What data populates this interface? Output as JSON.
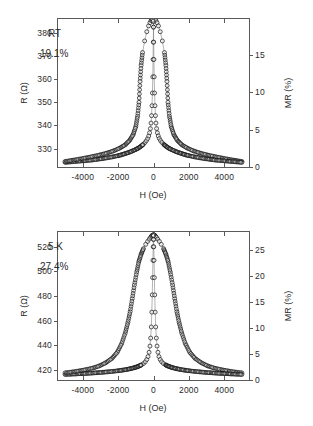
{
  "figure": {
    "background": "#ffffff",
    "axis_color": "#5a5a5a",
    "marker_color": "#111111"
  },
  "panels": [
    {
      "id": "panel-top",
      "annotation_label": "RT",
      "annotation_value": "19.1%",
      "x_axis": {
        "title": "H (Oe)",
        "min": -5400,
        "max": 5400,
        "ticks": [
          -4000,
          -2000,
          0,
          2000,
          4000
        ],
        "tick_labels": [
          "-4000",
          "-2000",
          "0",
          "2000",
          "4000"
        ]
      },
      "y_left": {
        "title": "R (Ω)",
        "min": 322,
        "max": 386,
        "ticks": [
          330,
          340,
          350,
          360,
          370,
          380
        ],
        "tick_labels": [
          "330",
          "340",
          "350",
          "360",
          "370",
          "380"
        ]
      },
      "y_right": {
        "title": "MR (%)",
        "min": 0,
        "max": 19.8,
        "ticks": [
          0,
          5,
          10,
          15
        ],
        "tick_labels": [
          "0",
          "5",
          "10",
          "15"
        ]
      }
    },
    {
      "id": "panel-bottom",
      "annotation_label": "5 K",
      "annotation_value": "27.4%",
      "x_axis": {
        "title": "H (Oe)",
        "min": -5400,
        "max": 5400,
        "ticks": [
          -4000,
          -2000,
          0,
          2000,
          4000
        ],
        "tick_labels": [
          "-4000",
          "-2000",
          "0",
          "2000",
          "4000"
        ]
      },
      "y_left": {
        "title": "R (Ω)",
        "min": 412,
        "max": 532,
        "ticks": [
          420,
          440,
          460,
          480,
          500,
          520
        ],
        "tick_labels": [
          "420",
          "440",
          "460",
          "480",
          "500",
          "520"
        ]
      },
      "y_right": {
        "title": "MR (%)",
        "min": 0,
        "max": 28.5,
        "ticks": [
          0,
          5,
          10,
          15,
          20,
          25
        ],
        "tick_labels": [
          "0",
          "5",
          "10",
          "15",
          "20",
          "25"
        ]
      }
    }
  ],
  "chart_data": [
    {
      "type": "scatter",
      "title": "",
      "panel": "RT",
      "xlabel": "H (Oe)",
      "ylabel": "R (Ω)",
      "y2label": "MR (%)",
      "xlim": [
        -5400,
        5400
      ],
      "ylim": [
        322,
        386
      ],
      "y2lim": [
        0,
        19.8
      ],
      "grid": false,
      "legend": null,
      "marker": "open-circle",
      "annotations": [
        "RT",
        "19.1%"
      ],
      "series": [
        {
          "name": "decreasing-field-branch",
          "x": [
            -5000,
            -4700,
            -4400,
            -4100,
            -3800,
            -3500,
            -3200,
            -2900,
            -2600,
            -2300,
            -2000,
            -1800,
            -1600,
            -1400,
            -1200,
            -1000,
            -850,
            -700,
            -580,
            -480,
            -400,
            -330,
            -270,
            -220,
            -175,
            -140,
            -110,
            -85,
            -60,
            -40,
            -25,
            -12,
            0,
            15,
            35,
            60,
            95,
            140,
            200,
            280,
            380,
            500,
            620,
            700,
            760,
            820,
            900,
            1000,
            1150,
            1350,
            1600,
            1900,
            2250,
            2600,
            3000,
            3400,
            3800,
            4200,
            4600,
            5000
          ],
          "y": [
            324.0,
            324.2,
            324.4,
            324.6,
            324.8,
            325.0,
            325.3,
            325.6,
            326.0,
            326.4,
            326.9,
            327.3,
            327.8,
            328.3,
            328.9,
            329.6,
            330.2,
            331.0,
            331.8,
            332.6,
            333.4,
            334.3,
            335.4,
            336.8,
            338.6,
            341.0,
            344.2,
            348.5,
            354.0,
            361.0,
            368.5,
            376.0,
            382.5,
            385.0,
            385.6,
            385.8,
            385.7,
            385.3,
            384.4,
            383.0,
            380.5,
            376.5,
            371.5,
            366.0,
            359.0,
            350.0,
            344.0,
            339.5,
            336.0,
            333.5,
            331.6,
            330.2,
            329.0,
            328.1,
            327.3,
            326.6,
            326.0,
            325.4,
            324.9,
            324.4
          ]
        },
        {
          "name": "increasing-field-branch",
          "x": [
            -5000,
            -4600,
            -4200,
            -3800,
            -3400,
            -3000,
            -2600,
            -2250,
            -1900,
            -1600,
            -1350,
            -1150,
            -1000,
            -900,
            -820,
            -760,
            -700,
            -620,
            -500,
            -380,
            -280,
            -200,
            -140,
            -95,
            -60,
            -35,
            -15,
            0,
            12,
            25,
            40,
            60,
            85,
            110,
            140,
            175,
            220,
            270,
            330,
            400,
            480,
            580,
            700,
            850,
            1000,
            1200,
            1400,
            1600,
            1800,
            2000,
            2300,
            2600,
            2900,
            3200,
            3500,
            3800,
            4100,
            4400,
            4700,
            5000
          ],
          "y": [
            324.4,
            324.9,
            325.4,
            326.0,
            326.6,
            327.3,
            328.1,
            329.0,
            330.2,
            331.6,
            333.5,
            336.0,
            339.5,
            344.0,
            350.0,
            359.0,
            366.0,
            371.5,
            376.5,
            380.5,
            383.0,
            384.4,
            385.3,
            385.7,
            385.8,
            385.6,
            385.0,
            382.5,
            376.0,
            368.5,
            361.0,
            354.0,
            348.5,
            344.2,
            341.0,
            338.6,
            336.8,
            335.4,
            334.3,
            333.4,
            332.6,
            331.8,
            331.0,
            330.2,
            329.6,
            328.9,
            328.3,
            327.8,
            327.3,
            326.9,
            326.4,
            326.0,
            325.6,
            325.3,
            325.0,
            324.8,
            324.6,
            324.4,
            324.2,
            324.0
          ]
        }
      ]
    },
    {
      "type": "scatter",
      "title": "",
      "panel": "5 K",
      "xlabel": "H (Oe)",
      "ylabel": "R (Ω)",
      "y2label": "MR (%)",
      "xlim": [
        -5400,
        5400
      ],
      "ylim": [
        412,
        532
      ],
      "y2lim": [
        0,
        28.5
      ],
      "grid": false,
      "legend": null,
      "marker": "open-circle",
      "annotations": [
        "5 K",
        "27.4%"
      ],
      "series": [
        {
          "name": "decreasing-field-branch",
          "x": [
            -5000,
            -4700,
            -4400,
            -4100,
            -3800,
            -3500,
            -3200,
            -2900,
            -2600,
            -2300,
            -2000,
            -1750,
            -1500,
            -1300,
            -1100,
            -950,
            -800,
            -680,
            -560,
            -460,
            -380,
            -310,
            -250,
            -200,
            -160,
            -125,
            -95,
            -70,
            -50,
            -32,
            -18,
            -8,
            0,
            10,
            25,
            45,
            75,
            115,
            170,
            240,
            330,
            440,
            570,
            700,
            830,
            950,
            1080,
            1200,
            1320,
            1450,
            1600,
            1800,
            2050,
            2350,
            2700,
            3050,
            3400,
            3800,
            4200,
            4600,
            5000
          ],
          "y": [
            416.5,
            416.7,
            416.9,
            417.1,
            417.3,
            417.6,
            417.9,
            418.2,
            418.6,
            419.0,
            419.5,
            420.0,
            420.6,
            421.2,
            421.9,
            422.6,
            423.4,
            424.3,
            425.4,
            426.8,
            428.6,
            431.0,
            434.5,
            439.5,
            446.0,
            455.0,
            467.0,
            481.0,
            495.0,
            509.0,
            520.0,
            526.0,
            529.0,
            529.5,
            529.6,
            529.5,
            529.2,
            528.6,
            527.6,
            526.2,
            524.4,
            522.0,
            518.5,
            514.0,
            508.0,
            499.5,
            489.0,
            478.0,
            467.5,
            458.5,
            450.0,
            441.5,
            434.5,
            429.5,
            426.0,
            423.5,
            421.8,
            420.5,
            419.4,
            418.5,
            417.8
          ]
        },
        {
          "name": "increasing-field-branch",
          "x": [
            -5000,
            -4600,
            -4200,
            -3800,
            -3400,
            -3050,
            -2700,
            -2350,
            -2050,
            -1800,
            -1600,
            -1450,
            -1320,
            -1200,
            -1080,
            -950,
            -830,
            -700,
            -570,
            -440,
            -330,
            -240,
            -170,
            -115,
            -75,
            -45,
            -25,
            -10,
            0,
            8,
            18,
            32,
            50,
            70,
            95,
            125,
            160,
            200,
            250,
            310,
            380,
            460,
            560,
            680,
            800,
            950,
            1100,
            1300,
            1500,
            1750,
            2000,
            2300,
            2600,
            2900,
            3200,
            3500,
            3800,
            4100,
            4400,
            4700,
            5000
          ],
          "y": [
            417.8,
            418.5,
            419.4,
            420.5,
            421.8,
            423.5,
            426.0,
            429.5,
            434.5,
            441.5,
            450.0,
            458.5,
            467.5,
            478.0,
            489.0,
            499.5,
            508.0,
            514.0,
            518.5,
            522.0,
            524.4,
            526.2,
            527.6,
            528.6,
            529.2,
            529.5,
            529.6,
            529.5,
            529.0,
            526.0,
            520.0,
            509.0,
            495.0,
            481.0,
            467.0,
            455.0,
            446.0,
            439.5,
            434.5,
            431.0,
            428.6,
            426.8,
            425.4,
            424.3,
            423.4,
            422.6,
            421.9,
            421.2,
            420.6,
            420.0,
            419.5,
            419.0,
            418.6,
            418.2,
            417.9,
            417.6,
            417.3,
            417.1,
            416.9,
            416.7,
            416.5
          ]
        }
      ]
    }
  ]
}
